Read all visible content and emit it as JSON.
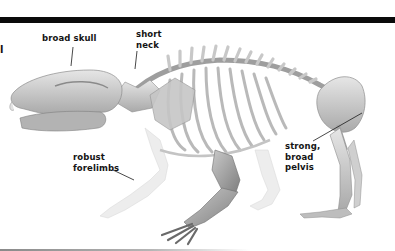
{
  "diagram": {
    "edge_text": "l",
    "labels": [
      {
        "id": "skull",
        "text": "broad skull"
      },
      {
        "id": "neck",
        "text": "short\nneck"
      },
      {
        "id": "forelimbs",
        "text": "robust\nforelimbs"
      },
      {
        "id": "pelvis",
        "text": "strong,\nbroad\npelvis"
      }
    ],
    "colors": {
      "rule": "#0a0a0a",
      "bone_light": "#dcdcdc",
      "bone_mid": "#b8b8b8",
      "bone_dark": "#8c8c8c",
      "label_text": "#141414"
    }
  }
}
